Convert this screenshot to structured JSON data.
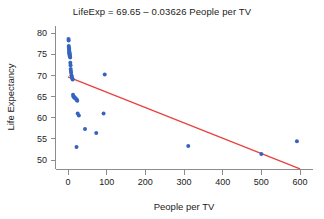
{
  "chart_data": {
    "type": "scatter",
    "title": "LifeExp = 69.65 – 0.03626 People per TV",
    "xlabel": "People per TV",
    "ylabel": "Life Expectancy",
    "xlim": [
      -40,
      640
    ],
    "ylim": [
      46.5,
      81.5
    ],
    "xticks": [
      0,
      100,
      200,
      300,
      400,
      500,
      600
    ],
    "yticks": [
      50,
      55,
      60,
      65,
      70,
      75,
      80
    ],
    "grid": false,
    "legend": null,
    "point_color": "#3564c0",
    "line_color": "#e8433f",
    "fit_line": {
      "label": "LifeExp = 69.65 – 0.03626 People per TV",
      "intercept": 69.65,
      "slope": -0.03626,
      "x_start": 0,
      "x_end": 600,
      "y_start": 69.65,
      "y_end": 47.89
    },
    "x": [
      1.3,
      1.7,
      2.0,
      2.2,
      2.6,
      3.0,
      3.2,
      3.4,
      3.6,
      3.8,
      4.0,
      4.3,
      4.5,
      5.0,
      5.6,
      6.0,
      6.6,
      7.0,
      7.5,
      8.0,
      9.0,
      10.0,
      11.0,
      12.0,
      13.0,
      14.0,
      15.0,
      17.0,
      18.0,
      20.0,
      22.0,
      23.0,
      24.0,
      25.0,
      28.0,
      44.0,
      73.0,
      92.0,
      95.0,
      311.0,
      500.0,
      592.0
    ],
    "y": [
      78.6,
      78.2,
      76.9,
      76.5,
      76.4,
      76.0,
      75.8,
      75.5,
      75.4,
      75.2,
      75.0,
      74.8,
      74.6,
      74.5,
      74.2,
      73.0,
      72.4,
      71.5,
      71.0,
      70.6,
      70.0,
      69.6,
      69.3,
      69.0,
      65.4,
      65.0,
      64.9,
      64.8,
      64.6,
      64.5,
      64.3,
      64.2,
      64.0,
      61.0,
      60.5,
      57.3,
      56.4,
      61.0,
      70.2,
      53.3,
      51.4,
      54.4
    ],
    "points": [
      {
        "x": 1.3,
        "y": 78.6
      },
      {
        "x": 1.7,
        "y": 78.2
      },
      {
        "x": 2.0,
        "y": 76.9
      },
      {
        "x": 2.2,
        "y": 76.5
      },
      {
        "x": 2.6,
        "y": 76.4
      },
      {
        "x": 3.0,
        "y": 76.0
      },
      {
        "x": 3.2,
        "y": 75.8
      },
      {
        "x": 3.4,
        "y": 75.5
      },
      {
        "x": 3.6,
        "y": 75.4
      },
      {
        "x": 3.8,
        "y": 75.2
      },
      {
        "x": 4.0,
        "y": 75.0
      },
      {
        "x": 4.3,
        "y": 74.8
      },
      {
        "x": 4.5,
        "y": 74.6
      },
      {
        "x": 5.0,
        "y": 74.5
      },
      {
        "x": 5.6,
        "y": 74.2
      },
      {
        "x": 6.0,
        "y": 73.0
      },
      {
        "x": 6.6,
        "y": 72.4
      },
      {
        "x": 7.0,
        "y": 71.5
      },
      {
        "x": 7.5,
        "y": 71.0
      },
      {
        "x": 8.0,
        "y": 70.6
      },
      {
        "x": 9.0,
        "y": 70.0
      },
      {
        "x": 10.0,
        "y": 69.6
      },
      {
        "x": 11.0,
        "y": 69.3
      },
      {
        "x": 12.0,
        "y": 69.0
      },
      {
        "x": 13.0,
        "y": 65.4
      },
      {
        "x": 14.0,
        "y": 65.0
      },
      {
        "x": 15.0,
        "y": 64.9
      },
      {
        "x": 17.0,
        "y": 64.8
      },
      {
        "x": 18.0,
        "y": 64.6
      },
      {
        "x": 20.0,
        "y": 64.5
      },
      {
        "x": 22.0,
        "y": 64.3
      },
      {
        "x": 23.0,
        "y": 64.2
      },
      {
        "x": 24.0,
        "y": 64.0
      },
      {
        "x": 25.0,
        "y": 61.0
      },
      {
        "x": 28.0,
        "y": 60.5
      },
      {
        "x": 44.0,
        "y": 57.3
      },
      {
        "x": 73.0,
        "y": 56.4
      },
      {
        "x": 92.0,
        "y": 61.0
      },
      {
        "x": 95.0,
        "y": 70.2
      },
      {
        "x": 311.0,
        "y": 53.3
      },
      {
        "x": 500.0,
        "y": 51.4
      },
      {
        "x": 592.0,
        "y": 54.4
      },
      {
        "x": 22.0,
        "y": 53.1
      }
    ]
  }
}
